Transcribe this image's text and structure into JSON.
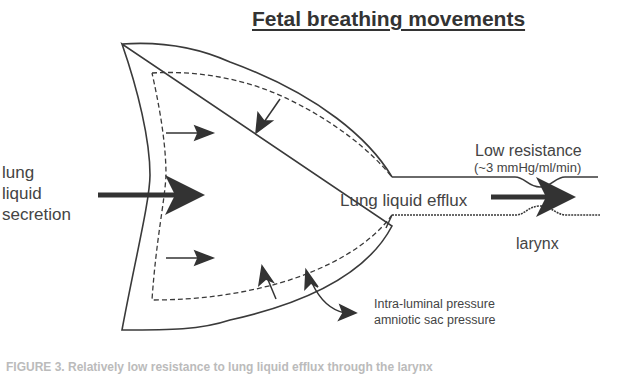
{
  "title": "Fetal breathing movements",
  "labels": {
    "secretion_line1": "lung",
    "secretion_line2": "liquid",
    "secretion_line3": "secretion",
    "efflux": "Lung liquid efflux",
    "resistance": "Low resistance",
    "resistance_value": "(~3 mmHg/ml/min)",
    "larynx": "larynx",
    "pressure_line1": "Intra-luminal pressure",
    "pressure_line2": "amniotic sac pressure"
  },
  "caption": "FIGURE 3. Relatively low resistance to lung liquid efflux through the larynx",
  "colors": {
    "stroke": "#3a3a3a",
    "arrow": "#333333",
    "background": "#ffffff"
  }
}
